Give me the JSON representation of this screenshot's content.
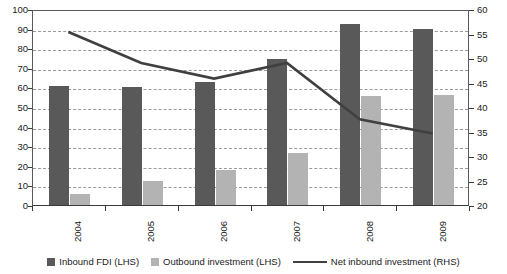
{
  "chart_data": {
    "type": "bar",
    "title": "",
    "subtitle": "",
    "xlabel": "",
    "ylabel": "",
    "categories": [
      "2004",
      "2005",
      "2006",
      "2007",
      "2008",
      "2009"
    ],
    "series": [
      {
        "name": "Inbound FDI (LHS)",
        "type": "bar",
        "axis": "left",
        "color": "#595959",
        "values": [
          60.5,
          60.2,
          63,
          74.5,
          92.5,
          90
        ]
      },
      {
        "name": "Outbound investment (LHS)",
        "type": "bar",
        "axis": "left",
        "color": "#b3b3b3",
        "values": [
          5.5,
          12,
          18,
          26.5,
          55.5,
          56
        ]
      },
      {
        "name": "Net inbound investment (RHS)",
        "type": "line",
        "axis": "right",
        "color": "#404040",
        "values": [
          55.5,
          49.2,
          46,
          49.2,
          37.7,
          34.8
        ]
      }
    ],
    "left_axis": {
      "min": 0,
      "max": 100,
      "step": 10,
      "ticks": [
        "0",
        "10",
        "20",
        "30",
        "40",
        "50",
        "60",
        "70",
        "80",
        "90",
        "100"
      ]
    },
    "right_axis": {
      "min": 20,
      "max": 60,
      "step": 5,
      "ticks": [
        "20",
        "25",
        "30",
        "35",
        "40",
        "45",
        "50",
        "55",
        "60"
      ]
    },
    "grid": true,
    "legend_position": "bottom"
  },
  "legend": {
    "items": [
      {
        "label": "Inbound FDI (LHS)",
        "swatch": "square",
        "color": "#595959"
      },
      {
        "label": "Outbound investment (LHS)",
        "swatch": "square",
        "color": "#b3b3b3"
      },
      {
        "label": "Net inbound investment (RHS)",
        "swatch": "line",
        "color": "#404040"
      }
    ]
  }
}
